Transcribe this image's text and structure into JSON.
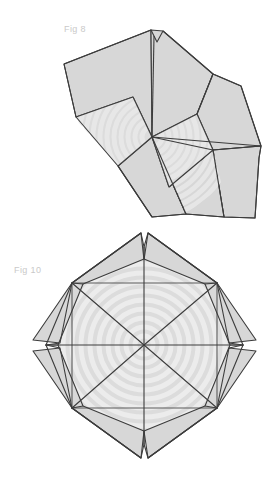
{
  "sheet": {
    "title": "Deployable folding structure figures",
    "background_color": "#ffffff",
    "width": 273,
    "height": 482
  },
  "style": {
    "panel_fill": "#d7d7d7",
    "panel_fill_light": "#dedede",
    "stripe_light": "#e9e9e9",
    "stripe_dark": "#cfcfcf",
    "crease_stroke": "#3c3c3c",
    "crease_stroke_light": "#5a5a5a",
    "label_color": "#c9c9c9",
    "stroke_width": 1.1
  },
  "figures": [
    {
      "id": "fig-8",
      "label": "Fig 8",
      "label_x": 64,
      "label_y": 32,
      "caption": "Partially folded eight-fold deployable panel assembly",
      "state": "partially-folded",
      "fold_count": 8,
      "hub": {
        "x": 152,
        "y": 137
      },
      "notch": {
        "x": 157,
        "y": 31,
        "depth": 10
      },
      "bounds": {
        "x": 63,
        "y": 26,
        "width": 200,
        "height": 192
      }
    },
    {
      "id": "fig-10",
      "label": "Fig 10",
      "label_x": 14,
      "label_y": 273,
      "caption": "Fully unfolded eight-fold deployable panel assembly",
      "state": "unfolded",
      "fold_count": 8,
      "hub": {
        "x": 144,
        "y": 345
      },
      "ring_count": 8,
      "bounds": {
        "x": 38,
        "y": 232,
        "width": 218,
        "height": 222
      }
    }
  ]
}
